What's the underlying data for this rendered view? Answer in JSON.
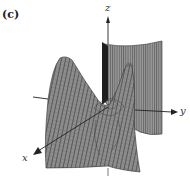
{
  "figure": {
    "panel_label": "(c)",
    "axes": {
      "x_label": "x",
      "y_label": "y",
      "z_label": "z"
    },
    "colors": {
      "surface": "#8f8f8f",
      "surface_dark": "#5a5a5a",
      "mesh": "#3a3a3a",
      "axis": "#222222"
    }
  }
}
